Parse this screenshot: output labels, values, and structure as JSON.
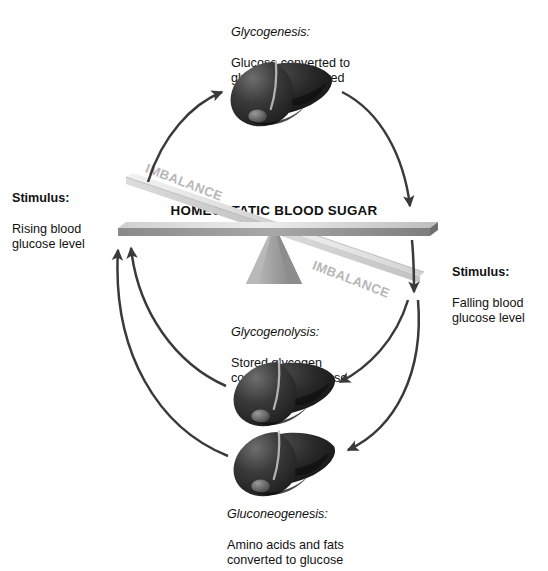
{
  "diagram": {
    "title": "HOMEOSTATIC BLOOD SUGAR",
    "beam_label": "HOMEOSTATIC BLOOD SUGAR",
    "imbalance_left": "IMBALANCE",
    "imbalance_right": "IMBALANCE",
    "colors": {
      "background": "#ffffff",
      "text": "#111111",
      "arrow": "#3a3a3a",
      "beam_top": "#d9d9d9",
      "beam_face": "#8e8e8e",
      "tilted_plank": "#e6e6e6",
      "fulcrum": "#a6a6a6",
      "imbalance_text": "#b7b7b7",
      "liver_dark": "#232323",
      "liver_mid": "#3d3d3d",
      "liver_light": "#6a6a6a"
    }
  },
  "labels": {
    "glycogenesis": {
      "heading": "Glycogenesis:",
      "body": "Glucose converted to\nglycogen and stored"
    },
    "glycogenolysis": {
      "heading": "Glycogenolysis:",
      "body": "Stored glycogen\nconverted to glucose"
    },
    "gluconeogenesis": {
      "heading": "Gluconeogenesis:",
      "body": "Amino acids and fats\nconverted to glucose"
    },
    "stimulus_left": {
      "heading": "Stimulus:",
      "body": "Rising blood\nglucose level"
    },
    "stimulus_right": {
      "heading": "Stimulus:",
      "body": "Falling blood\nglucose level"
    }
  },
  "organs": [
    {
      "name": "liver-top",
      "label": "liver"
    },
    {
      "name": "liver-middle",
      "label": "liver"
    },
    {
      "name": "liver-bottom",
      "label": "liver"
    }
  ],
  "arrows": [
    {
      "name": "arrow-beam-left-to-liver-top",
      "direction": "up-right"
    },
    {
      "name": "arrow-liver-top-to-beam-right",
      "direction": "down-right"
    },
    {
      "name": "arrow-beam-right-down",
      "direction": "down"
    },
    {
      "name": "arrow-to-liver-middle",
      "direction": "down-left"
    },
    {
      "name": "arrow-to-liver-bottom",
      "direction": "down-left"
    },
    {
      "name": "arrow-liver-middle-to-beam-left",
      "direction": "up-left"
    },
    {
      "name": "arrow-liver-bottom-to-beam-left",
      "direction": "up-left"
    }
  ]
}
